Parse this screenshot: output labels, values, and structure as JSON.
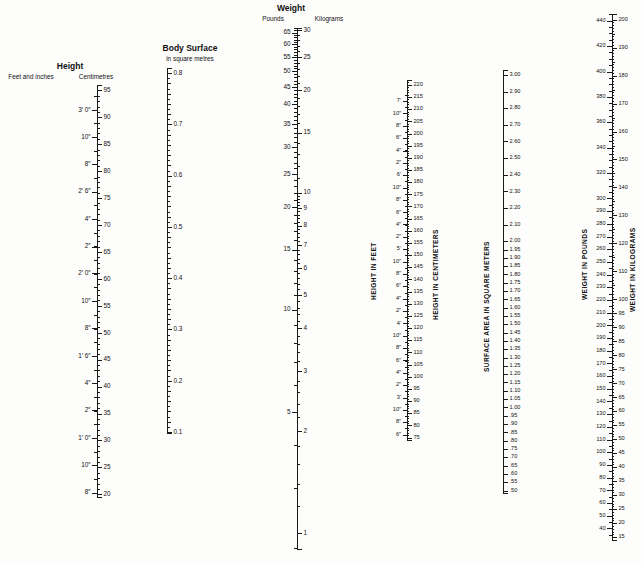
{
  "figure": {
    "title": "",
    "kind": "nomogram-body-surface-area"
  },
  "chart_data": {
    "type": "table",
    "xlabel": "",
    "ylabel": "",
    "grid": false,
    "legend_position": "none",
    "scales": [
      {
        "id": "infant-height",
        "header_line1": "Height",
        "header_left": "Feet and inches",
        "header_right": "Centimetres",
        "axis": {
          "top_value": 96,
          "bottom_value": 19.5,
          "unit": "cm"
        },
        "right_ticks": [
          95,
          90,
          85,
          80,
          75,
          70,
          65,
          60,
          55,
          50,
          45,
          40,
          35,
          30,
          25,
          20
        ],
        "left_ticks": [
          {
            "value": 91.4,
            "label": "3′ 0″"
          },
          {
            "value": 86.4,
            "label": "10″"
          },
          {
            "value": 81.3,
            "label": "8″"
          },
          {
            "value": 76.2,
            "label": "2′ 6″"
          },
          {
            "value": 71.1,
            "label": "4″"
          },
          {
            "value": 66.0,
            "label": "2″"
          },
          {
            "value": 61.0,
            "label": "2′ 0″"
          },
          {
            "value": 55.9,
            "label": "10″"
          },
          {
            "value": 50.8,
            "label": "8″"
          },
          {
            "value": 45.7,
            "label": "1′ 6″"
          },
          {
            "value": 40.6,
            "label": "4″"
          },
          {
            "value": 35.6,
            "label": "2″"
          },
          {
            "value": 30.5,
            "label": "1′ 0″"
          },
          {
            "value": 25.4,
            "label": "10″"
          },
          {
            "value": 20.3,
            "label": "8″"
          }
        ]
      },
      {
        "id": "body-surface-small",
        "header_line1": "Body Surface",
        "header_line2": "in square metres",
        "axis": {
          "top_value": 0.81,
          "bottom_value": 0.098,
          "unit": "m²"
        },
        "right_ticks": [
          0.8,
          0.7,
          0.6,
          0.5,
          0.4,
          0.3,
          0.2,
          0.1
        ],
        "minor_step": 0.02
      },
      {
        "id": "infant-weight",
        "header_line1": "Weight",
        "header_left": "Pounds",
        "header_right": "Kilograms",
        "axis": {
          "top_value": 30.4,
          "bottom_value": 0.9,
          "unit": "kg"
        },
        "left_unit": "lb",
        "left_ticks": [
          65,
          60,
          55,
          50,
          45,
          40,
          35,
          30,
          25,
          20,
          15,
          10,
          5
        ],
        "right_ticks": [
          30,
          25,
          20,
          15,
          10,
          9,
          8,
          7,
          6,
          5,
          4,
          3,
          2,
          1
        ]
      },
      {
        "id": "height-feet-cm",
        "vertical_left": "HEIGHT IN FEET",
        "vertical_right": "HEIGHT IN CENTIMETERS",
        "axis": {
          "top_value": 222,
          "bottom_value": 74,
          "unit": "cm"
        },
        "right_ticks": [
          220,
          215,
          210,
          205,
          200,
          195,
          190,
          185,
          180,
          175,
          170,
          165,
          160,
          155,
          150,
          145,
          140,
          135,
          130,
          125,
          120,
          115,
          110,
          105,
          100,
          95,
          90,
          85,
          80,
          75
        ],
        "left_ticks": [
          {
            "value": 213.4,
            "label": "7′"
          },
          {
            "value": 208.3,
            "label": "10″"
          },
          {
            "value": 203.2,
            "label": "8″"
          },
          {
            "value": 198.1,
            "label": "6″"
          },
          {
            "value": 193.0,
            "label": "4″"
          },
          {
            "value": 187.9,
            "label": "2″"
          },
          {
            "value": 182.9,
            "label": "6′"
          },
          {
            "value": 177.8,
            "label": "10″"
          },
          {
            "value": 172.7,
            "label": "8″"
          },
          {
            "value": 167.6,
            "label": "6″"
          },
          {
            "value": 162.6,
            "label": "4″"
          },
          {
            "value": 157.5,
            "label": "2″"
          },
          {
            "value": 152.4,
            "label": "5′"
          },
          {
            "value": 147.3,
            "label": "10″"
          },
          {
            "value": 142.2,
            "label": "8″"
          },
          {
            "value": 137.2,
            "label": "6″"
          },
          {
            "value": 132.1,
            "label": "4″"
          },
          {
            "value": 127.0,
            "label": "2″"
          },
          {
            "value": 121.9,
            "label": "4′"
          },
          {
            "value": 116.8,
            "label": "10″"
          },
          {
            "value": 111.8,
            "label": "8″"
          },
          {
            "value": 106.7,
            "label": "6″"
          },
          {
            "value": 101.6,
            "label": "4″"
          },
          {
            "value": 96.5,
            "label": "2″"
          },
          {
            "value": 91.4,
            "label": "3′"
          },
          {
            "value": 86.4,
            "label": "10″"
          },
          {
            "value": 81.3,
            "label": "8″"
          },
          {
            "value": 76.2,
            "label": "6″"
          }
        ]
      },
      {
        "id": "surface-area-sqm",
        "vertical_left": "SURFACE AREA IN SQUARE METERS",
        "axis": {
          "top_value": 3.03,
          "bottom_value": 0.485,
          "unit": "m²"
        },
        "right_ticks": [
          "3.00",
          "2.90",
          "2.80",
          "2.70",
          "2.60",
          "2.50",
          "2.40",
          "2.30",
          "2.20",
          "2.10",
          "2.00",
          "1.95",
          "1.90",
          "1.85",
          "1.80",
          "1.75",
          "1.70",
          "1.65",
          "1.60",
          "1.55",
          "1.50",
          "1.45",
          "1.40",
          "1.35",
          "1.30",
          "1.25",
          "1.20",
          "1.15",
          "1.10",
          "1.05",
          "1.00",
          ".95",
          ".90",
          ".85",
          ".80",
          ".75",
          ".70",
          ".65",
          ".60",
          ".55",
          ".50"
        ]
      },
      {
        "id": "weight-lb-kg",
        "vertical_left": "WEIGHT IN POUNDS",
        "vertical_right": "WEIGHT IN KILOGRAMS",
        "axis": {
          "top_value": 202,
          "bottom_value": 14,
          "unit": "kg"
        },
        "left_unit": "lb",
        "left_ticks": [
          440,
          420,
          400,
          380,
          360,
          340,
          320,
          300,
          290,
          280,
          270,
          260,
          250,
          240,
          230,
          220,
          210,
          200,
          190,
          180,
          170,
          160,
          150,
          140,
          130,
          120,
          110,
          100,
          90,
          80,
          70,
          60,
          50,
          40
        ],
        "right_ticks": [
          200,
          190,
          180,
          170,
          160,
          150,
          140,
          130,
          120,
          110,
          100,
          95,
          90,
          85,
          80,
          75,
          70,
          65,
          60,
          55,
          50,
          45,
          40,
          35,
          30,
          25,
          20,
          15
        ]
      }
    ]
  }
}
